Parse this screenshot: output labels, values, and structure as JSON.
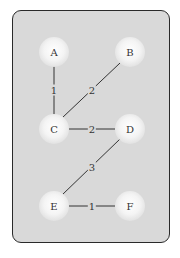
{
  "graph": {
    "nodes": [
      {
        "id": "A",
        "label": "A",
        "x": 54,
        "y": 52
      },
      {
        "id": "B",
        "label": "B",
        "x": 130,
        "y": 52
      },
      {
        "id": "C",
        "label": "C",
        "x": 54,
        "y": 129
      },
      {
        "id": "D",
        "label": "D",
        "x": 130,
        "y": 129
      },
      {
        "id": "E",
        "label": "E",
        "x": 54,
        "y": 206
      },
      {
        "id": "F",
        "label": "F",
        "x": 130,
        "y": 206
      }
    ],
    "edges": [
      {
        "from": "A",
        "to": "C",
        "weight": "1",
        "lx": 54,
        "ly": 90
      },
      {
        "from": "C",
        "to": "B",
        "weight": "2",
        "lx": 92,
        "ly": 90
      },
      {
        "from": "C",
        "to": "D",
        "weight": "2",
        "lx": 92,
        "ly": 129
      },
      {
        "from": "D",
        "to": "E",
        "weight": "3",
        "lx": 92,
        "ly": 167
      },
      {
        "from": "E",
        "to": "F",
        "weight": "1",
        "lx": 92,
        "ly": 206
      }
    ]
  },
  "colors": {
    "card": "#d9d9d9",
    "border": "#2a2a2a",
    "edge": "#333333"
  }
}
